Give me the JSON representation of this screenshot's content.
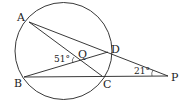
{
  "diagram": {
    "type": "circle-geometry",
    "circle": {
      "cx": 63.5,
      "cy": 51,
      "r": 48.5
    },
    "points": {
      "A": {
        "label": "A",
        "x": 29,
        "y": 22
      },
      "B": {
        "label": "B",
        "x": 24,
        "y": 77
      },
      "C": {
        "label": "C",
        "x": 102,
        "y": 76
      },
      "D": {
        "label": "D",
        "x": 108,
        "y": 52
      },
      "Q": {
        "label": "Q",
        "x": 81,
        "y": 61
      },
      "P": {
        "label": "P",
        "x": 168,
        "y": 76
      }
    },
    "segments": [
      [
        "A",
        "C"
      ],
      [
        "A",
        "P"
      ],
      [
        "B",
        "D"
      ],
      [
        "B",
        "P"
      ]
    ],
    "angles": {
      "at_Q": {
        "label": "51°"
      },
      "at_P": {
        "label": "21°"
      }
    }
  }
}
